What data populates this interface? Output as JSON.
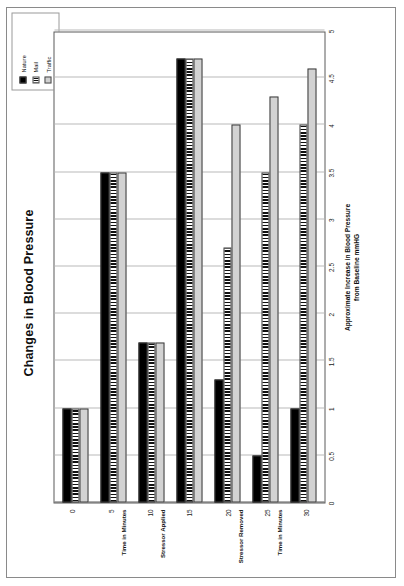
{
  "chart_data": {
    "type": "bar",
    "orientation": "horizontal",
    "title": "Changes in Blood Pressure",
    "xlabel": "Approximate Increase in Blood Pressure from Baseline mmHG",
    "xlabel_line1": "Approximate Increase in Blood Pressure",
    "xlabel_line2": "from Baseline mmHG",
    "ylabel": "Time in Minutes",
    "categories": [
      "0",
      "5",
      "10",
      "15",
      "20",
      "25",
      "30"
    ],
    "category_annotations": [
      {
        "category": "5",
        "text": "Time in Minutes"
      },
      {
        "category": "10",
        "text": "Stressor Applied"
      },
      {
        "category": "20",
        "text": "Stressor Removed"
      },
      {
        "category": "25",
        "text": "Time in Minutes"
      }
    ],
    "series": [
      {
        "name": "Nature",
        "values": [
          1.0,
          3.5,
          1.7,
          4.7,
          1.3,
          0.5,
          1.0
        ],
        "color": "#000000",
        "fill": "solid"
      },
      {
        "name": "Mail",
        "values": [
          1.0,
          3.5,
          1.7,
          4.7,
          2.7,
          3.5,
          4.0
        ],
        "color": "#111111",
        "fill": "vertical-stripes"
      },
      {
        "name": "Traffic",
        "values": [
          1.0,
          3.5,
          1.7,
          4.7,
          4.0,
          4.3,
          4.6
        ],
        "color": "#d2d2d2",
        "fill": "solid-light"
      }
    ],
    "xlim": [
      0,
      5
    ],
    "xticks": [
      "0",
      "0.5",
      "1",
      "1.5",
      "2",
      "2.5",
      "3",
      "3.5",
      "4",
      "4.5",
      "5"
    ],
    "xtick_values": [
      0,
      0.5,
      1,
      1.5,
      2,
      2.5,
      3,
      3.5,
      4,
      4.5,
      5
    ],
    "grid": true,
    "grid_axis": "value",
    "legend_position": "top-right",
    "legend_entries": [
      "Nature",
      "Mail",
      "Traffic"
    ]
  },
  "page": {
    "rotation": "chart rotated 90 degrees counter-clockwise on page"
  }
}
